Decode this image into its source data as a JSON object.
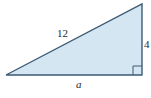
{
  "diagram": {
    "type": "right-triangle",
    "colors": {
      "fill": "#d4e6f1",
      "stroke": "#3d5a73",
      "text": "#2b2b2b"
    },
    "vertices": {
      "left": [
        6,
        75
      ],
      "top_right": [
        142,
        4
      ],
      "bottom_right": [
        142,
        75
      ]
    },
    "labels": {
      "hypotenuse": "12",
      "vertical_leg": "4",
      "horizontal_leg": "a"
    },
    "right_angle_marker": "bottom-right"
  }
}
